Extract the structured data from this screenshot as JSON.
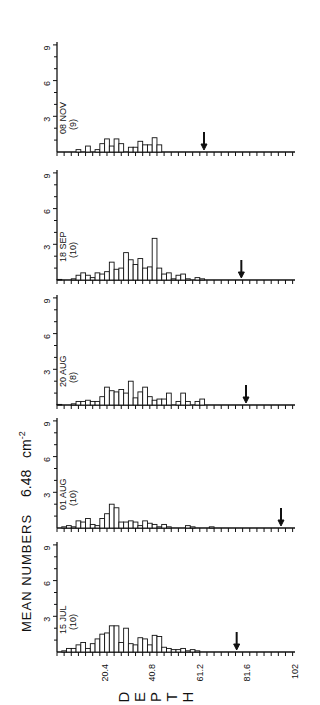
{
  "figure": {
    "ylabel_main": "MEAN NUMBERS",
    "ylabel_density_value": "6.48",
    "ylabel_density_unit": "cm",
    "ylabel_density_exp": "-2",
    "xlabel_letters": [
      "D",
      "E",
      "P",
      "T",
      "H"
    ]
  },
  "chart_data": {
    "type": "bar",
    "title": "",
    "xlabel": "DEPTH",
    "ylabel": "MEAN NUMBERS 6.48 cm-2",
    "xlim": [
      0,
      102
    ],
    "ylim": [
      0,
      9
    ],
    "x_tick_labels": [
      "20.4",
      "40.8",
      "61.2",
      "81.6",
      "102"
    ],
    "x_tick_values": [
      20.4,
      40.8,
      61.2,
      81.6,
      102
    ],
    "y_tick_labels": [
      "3",
      "6",
      "9"
    ],
    "y_tick_values": [
      3,
      6,
      9
    ],
    "bin_width": 2.04,
    "orientation_note": "figure rotated 90 degrees counterclockwise; panels stacked",
    "panels": [
      {
        "label": "08 NOV",
        "n": "(9)",
        "arrow_depth": 63,
        "values": [
          0,
          0,
          0,
          0,
          0.2,
          0,
          0.5,
          0,
          0.2,
          0.7,
          1.1,
          0.5,
          1.1,
          0.7,
          0,
          0.4,
          0.4,
          0.9,
          0.6,
          0.6,
          1.2,
          0.6,
          0,
          0,
          0,
          0,
          0,
          0,
          0,
          0,
          0,
          0,
          0,
          0,
          0,
          0,
          0,
          0,
          0,
          0,
          0,
          0,
          0,
          0,
          0,
          0,
          0,
          0,
          0,
          0
        ]
      },
      {
        "label": "18 SEP",
        "n": "(10)",
        "arrow_depth": 79,
        "values": [
          0.05,
          0,
          0,
          0.1,
          0.4,
          0.6,
          0.4,
          0.2,
          0.6,
          0.5,
          0.7,
          1.5,
          0.9,
          1.0,
          2.3,
          1.7,
          1.3,
          1.8,
          1.0,
          1.1,
          3.5,
          1.0,
          0.5,
          0.6,
          0.1,
          0.4,
          0.5,
          0.1,
          0,
          0.2,
          0.1,
          0,
          0,
          0,
          0,
          0,
          0,
          0,
          0,
          0,
          0,
          0,
          0,
          0,
          0,
          0,
          0,
          0,
          0,
          0
        ]
      },
      {
        "label": "20 AUG",
        "n": "(8)",
        "arrow_depth": 81,
        "values": [
          0.05,
          0,
          0,
          0.1,
          0.3,
          0.3,
          0.4,
          0.3,
          0.3,
          0.7,
          1.5,
          1.2,
          1.1,
          1.3,
          1.0,
          2.0,
          0.6,
          1.1,
          1.5,
          0.7,
          0.4,
          0.5,
          0.5,
          1.0,
          0,
          0.3,
          1.0,
          0.3,
          0,
          0.3,
          0.5,
          0,
          0,
          0,
          0,
          0,
          0,
          0,
          0,
          0,
          0,
          0,
          0,
          0,
          0,
          0,
          0,
          0,
          0,
          0
        ]
      },
      {
        "label": "01 AUG",
        "n": "(10)",
        "arrow_depth": 96,
        "values": [
          0,
          0.1,
          0.2,
          0.1,
          0.6,
          0.5,
          0.8,
          0.3,
          0.2,
          0.8,
          1.2,
          2.0,
          1.7,
          0.5,
          0.5,
          0.6,
          0.5,
          0.2,
          0.6,
          0.4,
          0.3,
          0.1,
          0.3,
          0.1,
          0,
          0,
          0,
          0.2,
          0.1,
          0,
          0,
          0,
          0.1,
          0,
          0,
          0,
          0,
          0,
          0,
          0,
          0,
          0,
          0,
          0,
          0,
          0,
          0,
          0,
          0,
          0
        ]
      },
      {
        "label": "15 JUL",
        "n": "(10)",
        "arrow_depth": 77,
        "values": [
          0,
          0.1,
          0.3,
          0.3,
          0.6,
          0.8,
          0.3,
          0.7,
          1.1,
          1.5,
          1.6,
          2.2,
          2.2,
          0.8,
          2.0,
          0.7,
          0.6,
          1.2,
          1.1,
          0.6,
          1.4,
          1.3,
          0.4,
          0.3,
          0.2,
          0.2,
          0.3,
          0.1,
          0.2,
          0.1,
          0,
          0,
          0,
          0,
          0,
          0,
          0,
          0,
          0,
          0,
          0,
          0,
          0,
          0,
          0,
          0,
          0,
          0,
          0,
          0
        ]
      }
    ]
  }
}
